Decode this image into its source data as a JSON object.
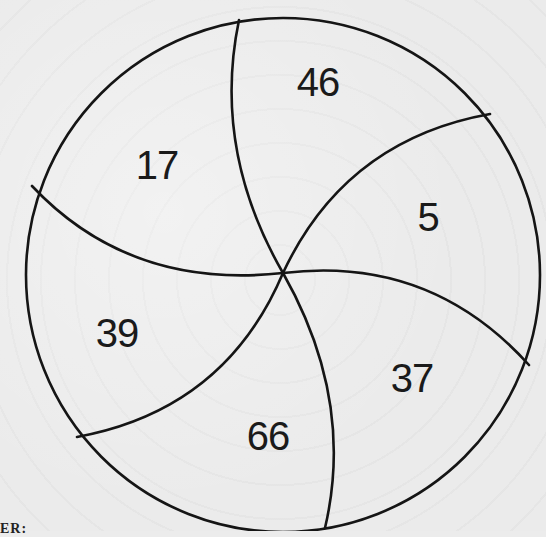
{
  "puzzle": {
    "type": "circle divided into six curved segments",
    "segments": [
      {
        "id": "top",
        "value": "46",
        "x": 318,
        "y": 80
      },
      {
        "id": "upper-right",
        "value": "5",
        "x": 428,
        "y": 217
      },
      {
        "id": "lower-right",
        "value": "37",
        "x": 412,
        "y": 378
      },
      {
        "id": "bottom",
        "value": "66",
        "x": 268,
        "y": 436
      },
      {
        "id": "lower-left",
        "value": "39",
        "x": 116,
        "y": 333
      },
      {
        "id": "upper-left",
        "value": "17",
        "x": 157,
        "y": 165
      }
    ],
    "circle": {
      "cx": 283,
      "cy": 275,
      "r": 257
    },
    "hub": {
      "x": 283,
      "y": 273
    },
    "line_color": "#151515"
  },
  "footer": {
    "partial_text": "ER:"
  }
}
